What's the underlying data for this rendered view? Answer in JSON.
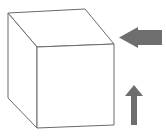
{
  "figure": {
    "background_color": "#ffffff",
    "width": 166,
    "height": 140
  },
  "chart_data": {
    "type": "diagram",
    "xlabel": "",
    "ylabel": "",
    "xlim": [
      0,
      166
    ],
    "ylim": [
      0,
      140
    ],
    "grid": false,
    "legend": false,
    "shapes": [
      {
        "name": "cube",
        "kind": "wireframe-box",
        "fill": "#ffffff",
        "stroke": "#6a6a6a",
        "stroke_width": 1,
        "vertices": {
          "front_top_left": [
            37,
            47
          ],
          "front_top_right": [
            114,
            44
          ],
          "front_bottom_right": [
            114,
            125
          ],
          "front_bottom_left": [
            37,
            128
          ],
          "back_top_left": [
            8,
            13
          ],
          "back_top_right": [
            85,
            9
          ],
          "back_bottom_left": [
            8,
            98
          ]
        },
        "faces": [
          {
            "name": "top-face",
            "points": "8,13 85,9 114,44 37,47"
          },
          {
            "name": "left-face",
            "points": "8,13 37,47 37,128 8,98"
          },
          {
            "name": "front-face",
            "points": "37,47 114,44 114,125 37,128"
          }
        ]
      },
      {
        "name": "left-pointing-arrow",
        "kind": "arrow",
        "direction": "left",
        "fill": "#6e6e6e",
        "points": "162,30 138,30 138,27 119,37.5 138,48 138,45 162,45",
        "bbox": [
          119,
          27,
          43,
          21
        ]
      },
      {
        "name": "up-pointing-arrow",
        "kind": "arrow",
        "direction": "up",
        "fill": "#6e6e6e",
        "points": "137,125 137,96 143,96 134,85 125,96 131,96 131,125",
        "bbox": [
          125,
          85,
          18,
          40
        ]
      }
    ],
    "colors": {
      "arrow_gray": "#6e6e6e",
      "cube_stroke": "#6a6a6a",
      "cube_fill": "#ffffff",
      "background": "#ffffff"
    }
  }
}
